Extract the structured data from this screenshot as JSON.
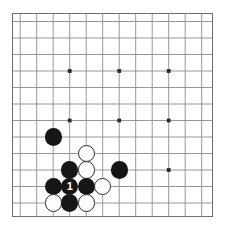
{
  "board": {
    "name": "go-board-diagram",
    "type": "go-board-corner",
    "columns": 12,
    "rows": 12,
    "origin_x": 8.2,
    "origin_y": 8.5,
    "cell": 16.5,
    "line_color": "#8c8c90",
    "edge_color": "#6e6e72",
    "background_color": "#ffffff",
    "star_color": "#2a2a2e",
    "star_points": [
      {
        "col": 3,
        "row": 3
      },
      {
        "col": 6,
        "row": 3
      },
      {
        "col": 9,
        "row": 3
      },
      {
        "col": 3,
        "row": 6
      },
      {
        "col": 6,
        "row": 6
      },
      {
        "col": 9,
        "row": 6
      },
      {
        "col": 9,
        "row": 9
      }
    ],
    "stone_radius": 8.6,
    "colors": {
      "black": "#161616",
      "white": "#fdfdfd",
      "white_outline": "#2a2a2e",
      "black_label": "#ffffff"
    },
    "stones": [
      {
        "col": 2,
        "row": 7,
        "color": "black",
        "label": ""
      },
      {
        "col": 4,
        "row": 8,
        "color": "white",
        "label": ""
      },
      {
        "col": 3,
        "row": 9,
        "color": "black",
        "label": ""
      },
      {
        "col": 4,
        "row": 9,
        "color": "white",
        "label": ""
      },
      {
        "col": 6,
        "row": 9,
        "color": "black",
        "label": ""
      },
      {
        "col": 2,
        "row": 10,
        "color": "black",
        "label": ""
      },
      {
        "col": 3,
        "row": 10,
        "color": "black",
        "label": "1"
      },
      {
        "col": 4,
        "row": 10,
        "color": "black",
        "label": ""
      },
      {
        "col": 5,
        "row": 10,
        "color": "white",
        "label": ""
      },
      {
        "col": 2,
        "row": 11,
        "color": "white",
        "label": ""
      },
      {
        "col": 3,
        "row": 11,
        "color": "black",
        "label": ""
      },
      {
        "col": 4,
        "row": 11,
        "color": "white",
        "label": ""
      }
    ]
  }
}
